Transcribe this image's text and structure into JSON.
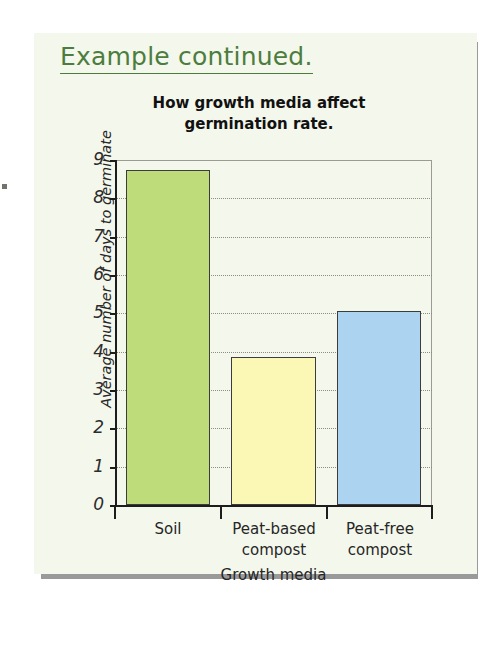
{
  "slide": {
    "heading": "Example continued.",
    "heading_color": "#4c7d3e",
    "background_color": "#f4f7ec",
    "shadow_color": "#9a9a9a"
  },
  "chart_data": {
    "type": "bar",
    "title": "How growth media affect germination rate.",
    "title_lines": [
      "How growth media affect",
      "germination rate."
    ],
    "xlabel": "Growth media",
    "ylabel": "Average number of days to germinate",
    "categories": [
      "Soil",
      "Peat-based compost",
      "Peat-free compost"
    ],
    "category_lines": [
      [
        "Soil"
      ],
      [
        "Peat-based",
        "compost"
      ],
      [
        "Peat-free",
        "compost"
      ]
    ],
    "values": [
      8.75,
      3.85,
      5.05
    ],
    "colors": [
      "#bedc7a",
      "#fbf7b5",
      "#acd4f0"
    ],
    "bar_border_color": "#3c3c3c",
    "ylim": [
      0,
      9
    ],
    "ytick_labels": [
      "0",
      "1",
      "2",
      "3",
      "4",
      "5",
      "6",
      "7",
      "8",
      "9"
    ],
    "ytick_values": [
      0,
      1,
      2,
      3,
      4,
      5,
      6,
      7,
      8,
      9
    ],
    "grid": true,
    "grid_axis": "y",
    "legend": "none"
  }
}
